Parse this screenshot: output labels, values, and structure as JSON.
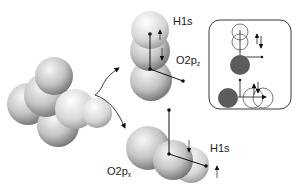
{
  "diagram": {
    "type": "molecular-orbital-illustration",
    "molecule": "water (space-filling model)",
    "labels": {
      "top_h": "H1s",
      "top_o": "O2p",
      "top_o_sub": "z",
      "bottom_o": "O2p",
      "bottom_o_sub": "x",
      "bottom_h": "H1s"
    },
    "spin_arrows": {
      "top_h": "up",
      "top_o": "down",
      "bottom_o": "down",
      "bottom_h": "up"
    },
    "inset": {
      "description": "schematic of orbital overlap with paired spins",
      "top_pair": "up-down",
      "bottom_pair": "up-down"
    },
    "colors": {
      "sphere_light": "#f2f2f2",
      "sphere_dark": "#6e6e6e",
      "inset_filled": "#5c5c5c",
      "line": "#111111"
    }
  }
}
